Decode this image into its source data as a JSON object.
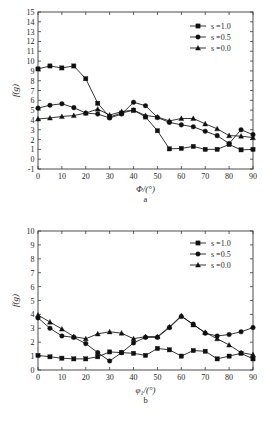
{
  "figure": {
    "background": "#ffffff",
    "ink_color": "#101010"
  },
  "chart_data": [
    {
      "id": "a",
      "type": "line",
      "title": "",
      "panel_label": "a",
      "xlabel": "Φ/(°)",
      "ylabel": "f(g)",
      "xlim": [
        0,
        90
      ],
      "ylim": [
        -1,
        15
      ],
      "xticks": [
        0,
        10,
        20,
        30,
        40,
        50,
        60,
        70,
        80,
        90
      ],
      "xticklabels": [
        "0",
        "10",
        "20",
        "30",
        "40",
        "50",
        "60",
        "70",
        "80",
        "90"
      ],
      "yticks": [
        -1,
        0,
        1,
        2,
        3,
        4,
        5,
        6,
        7,
        8,
        9,
        10,
        11,
        12,
        13,
        14,
        15
      ],
      "yticklabels": [
        "-1",
        "0",
        "1",
        "2",
        "3",
        "4",
        "5",
        "6",
        "7",
        "8",
        "9",
        "10",
        "11",
        "12",
        "13",
        "14",
        "15"
      ],
      "grid": false,
      "legend_position": "top-right",
      "x": [
        0,
        5,
        10,
        15,
        20,
        25,
        30,
        35,
        40,
        45,
        50,
        55,
        60,
        65,
        70,
        75,
        80,
        85,
        90
      ],
      "series": [
        {
          "name": "s =1.0",
          "marker": "square",
          "values": [
            9.2,
            9.5,
            9.3,
            9.5,
            8.2,
            5.7,
            4.3,
            4.7,
            5.0,
            4.3,
            2.9,
            1.05,
            1.1,
            1.3,
            1.0,
            1.0,
            1.5,
            0.95,
            1.0
          ]
        },
        {
          "name": "s =0.5",
          "marker": "circle",
          "values": [
            5.2,
            5.5,
            5.65,
            5.25,
            4.7,
            4.6,
            4.2,
            4.6,
            5.8,
            5.45,
            4.25,
            3.75,
            3.5,
            3.3,
            2.85,
            2.4,
            1.6,
            3.0,
            2.5
          ]
        },
        {
          "name": "s =0.0",
          "marker": "triangle",
          "values": [
            4.1,
            4.2,
            4.35,
            4.45,
            4.7,
            5.1,
            4.5,
            4.85,
            5.0,
            4.45,
            4.3,
            3.9,
            4.15,
            4.15,
            3.6,
            3.1,
            2.4,
            2.35,
            2.2
          ]
        }
      ]
    },
    {
      "id": "b",
      "type": "line",
      "title": "",
      "panel_label": "b",
      "xlabel": "φ₁/(°)",
      "ylabel": "f(g)",
      "xlim": [
        0,
        90
      ],
      "ylim": [
        0,
        10
      ],
      "xticks": [
        0,
        10,
        20,
        30,
        40,
        50,
        60,
        70,
        80,
        90
      ],
      "xticklabels": [
        "0",
        "10",
        "20",
        "30",
        "40",
        "50",
        "60",
        "70",
        "80",
        "90"
      ],
      "yticks": [
        0,
        1,
        2,
        3,
        4,
        5,
        6,
        7,
        8,
        9,
        10
      ],
      "yticklabels": [
        "0",
        "1",
        "2",
        "3",
        "4",
        "5",
        "6",
        "7",
        "8",
        "9",
        "10"
      ],
      "grid": false,
      "legend_position": "top-right",
      "x": [
        0,
        5,
        10,
        15,
        20,
        25,
        30,
        35,
        40,
        45,
        50,
        55,
        60,
        65,
        70,
        75,
        80,
        85,
        90
      ],
      "series": [
        {
          "name": "s =1.0",
          "marker": "square",
          "values": [
            1.05,
            0.95,
            0.85,
            0.8,
            0.8,
            0.95,
            1.3,
            1.25,
            1.2,
            1.05,
            1.55,
            1.45,
            1.0,
            1.4,
            1.35,
            0.8,
            1.0,
            1.2,
            0.8
          ]
        },
        {
          "name": "s =0.5",
          "marker": "circle",
          "values": [
            3.75,
            3.0,
            2.45,
            2.35,
            1.9,
            1.25,
            0.65,
            1.25,
            1.95,
            2.35,
            2.35,
            3.05,
            3.85,
            3.3,
            2.65,
            2.45,
            2.55,
            2.75,
            3.05
          ]
        },
        {
          "name": "s =0.0",
          "marker": "triangle",
          "values": [
            3.95,
            3.45,
            2.95,
            2.4,
            2.25,
            2.6,
            2.75,
            2.65,
            2.25,
            2.4,
            2.4,
            3.1,
            3.9,
            3.25,
            2.7,
            2.25,
            1.8,
            1.25,
            1.1
          ]
        }
      ]
    }
  ]
}
